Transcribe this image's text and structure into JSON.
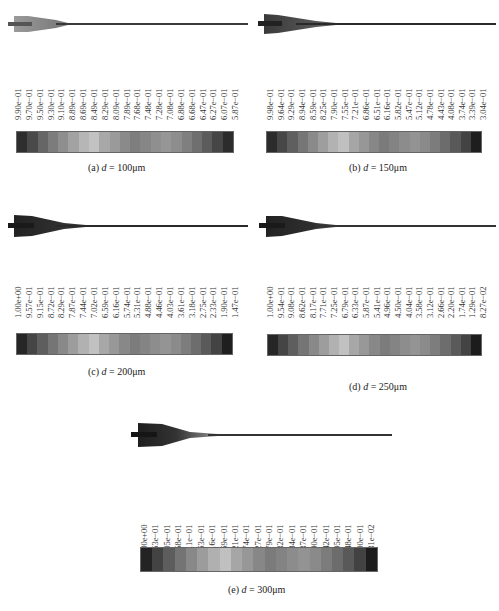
{
  "figure": {
    "panels": [
      {
        "id": "a",
        "caption_prefix": "(a) ",
        "caption_var": "d",
        "caption_eq": " = 100μm",
        "diameter": "100μm",
        "labels": [
          "9.90e−01",
          "9.70e−01",
          "9.50e−01",
          "9.30e−01",
          "9.10e−01",
          "8.89e−01",
          "8.69e−01",
          "8.49e−01",
          "8.29e−01",
          "8.09e−01",
          "7.89e−01",
          "7.68e−01",
          "7.48e−01",
          "7.28e−01",
          "7.08e−01",
          "6.88e−01",
          "6.68e−01",
          "6.47e−01",
          "6.27e−01",
          "6.07e−01",
          "5.87e−01"
        ],
        "colors": [
          "#2e2e2e",
          "#4a4a4a",
          "#666666",
          "#7c7c7c",
          "#8e8e8e",
          "#a2a2a2",
          "#b6b6b6",
          "#c2c2c2",
          "#a8a8a8",
          "#9a9a9a",
          "#8a8a8a",
          "#7e7e7e",
          "#868686",
          "#8f8f8f",
          "#969696",
          "#8d8d8d",
          "#7f7f7f",
          "#6f6f6f",
          "#5c5c5c",
          "#464646",
          "#2c2c2c"
        ]
      },
      {
        "id": "b",
        "caption_prefix": "(b) ",
        "caption_var": "d",
        "caption_eq": " = 150μm",
        "diameter": "150μm",
        "labels": [
          "9.98e−01",
          "9.64e−01",
          "9.29e−01",
          "8.94e−01",
          "8.59e−01",
          "8.25e−01",
          "7.90e−01",
          "7.55e−01",
          "7.21e−01",
          "6.86e−01",
          "6.51e−01",
          "6.16e−01",
          "5.82e−01",
          "5.47e−01",
          "5.12e−01",
          "4.78e−01",
          "4.43e−01",
          "4.08e−01",
          "3.74e−01",
          "3.39e−01",
          "3.04e−01"
        ],
        "colors": [
          "#2c2c2c",
          "#474747",
          "#5f5f5f",
          "#767676",
          "#8a8a8a",
          "#9e9e9e",
          "#b2b2b2",
          "#c0c0c0",
          "#a6a6a6",
          "#979797",
          "#878787",
          "#7b7b7b",
          "#838383",
          "#8c8c8c",
          "#939393",
          "#8a8a8a",
          "#7c7c7c",
          "#6c6c6c",
          "#595959",
          "#434343",
          "#1e1e1e"
        ]
      },
      {
        "id": "c",
        "caption_prefix": "(c) ",
        "caption_var": "d",
        "caption_eq": " = 200μm",
        "diameter": "200μm",
        "labels": [
          "1.00e+00",
          "9.57e−01",
          "9.15e−01",
          "8.72e−01",
          "8.29e−01",
          "7.87e−01",
          "7.44e−01",
          "7.02e−01",
          "6.59e−01",
          "6.16e−01",
          "5.74e−01",
          "5.31e−01",
          "4.88e−01",
          "4.46e−01",
          "4.03e−01",
          "3.61e−01",
          "3.18e−01",
          "2.75e−01",
          "2.33e−01",
          "1.90e−01",
          "1.47e−01"
        ],
        "colors": [
          "#262626",
          "#454545",
          "#5e5e5e",
          "#757575",
          "#898989",
          "#9d9d9d",
          "#b1b1b1",
          "#c1c1c1",
          "#a7a7a7",
          "#989898",
          "#888888",
          "#7c7c7c",
          "#848484",
          "#8d8d8d",
          "#949494",
          "#8b8b8b",
          "#7d7d7d",
          "#6d6d6d",
          "#5a5a5a",
          "#434343",
          "#1f1f1f"
        ]
      },
      {
        "id": "d",
        "caption_prefix": "(d) ",
        "caption_var": "d",
        "caption_eq": " = 250μm",
        "diameter": "250μm",
        "labels": [
          "1.00e+00",
          "9.54e−01",
          "9.08e−01",
          "8.62e−01",
          "8.17e−01",
          "7.71e−01",
          "7.25e−01",
          "6.79e−01",
          "6.33e−01",
          "5.87e−01",
          "5.41e−01",
          "4.96e−01",
          "4.50e−01",
          "4.04e−01",
          "3.58e−01",
          "3.12e−01",
          "2.66e−01",
          "2.20e−01",
          "1.74e−01",
          "1.29e−01",
          "8.27e−02"
        ],
        "colors": [
          "#262626",
          "#454545",
          "#5e5e5e",
          "#757575",
          "#898989",
          "#9d9d9d",
          "#b1b1b1",
          "#c1c1c1",
          "#a7a7a7",
          "#989898",
          "#888888",
          "#7c7c7c",
          "#848484",
          "#8d8d8d",
          "#949494",
          "#8b8b8b",
          "#7d7d7d",
          "#6d6d6d",
          "#5a5a5a",
          "#434343",
          "#1c1c1c"
        ]
      },
      {
        "id": "e",
        "caption_prefix": "(e) ",
        "caption_var": "d",
        "caption_eq": " = 300μm",
        "diameter": "300μm",
        "labels": [
          "1.00e+00",
          "9.53e−01",
          "9.05e−01",
          "8.58e−01",
          "8.11e−01",
          "7.63e−01",
          "7.16e−01",
          "6.69e−01",
          "6.21e−01",
          "5.74e−01",
          "5.27e−01",
          "4.79e−01",
          "4.32e−01",
          "3.84e−01",
          "3.37e−01",
          "2.90e−01",
          "2.42e−01",
          "1.95e−01",
          "1.48e−01",
          "1.00e−01",
          "5.31e−02"
        ],
        "colors": [
          "#232323",
          "#434343",
          "#5d5d5d",
          "#747474",
          "#888888",
          "#9c9c9c",
          "#b0b0b0",
          "#c0c0c0",
          "#a6a6a6",
          "#979797",
          "#878787",
          "#7b7b7b",
          "#838383",
          "#8c8c8c",
          "#939393",
          "#8a8a8a",
          "#7c7c7c",
          "#6c6c6c",
          "#595959",
          "#424242",
          "#1c1c1c"
        ]
      }
    ]
  }
}
